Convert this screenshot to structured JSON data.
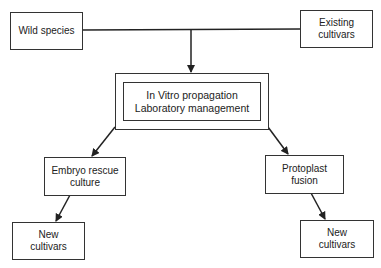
{
  "diagram": {
    "nodes": {
      "wild_species": "Wild species",
      "existing_cultivars_l1": "Existing",
      "existing_cultivars_l2": "cultivars",
      "in_vitro_l1": "In Vitro propagation",
      "in_vitro_l2": "Laboratory management",
      "embryo_l1": "Embryo rescue",
      "embryo_l2": "culture",
      "protoplast_l1": "Protoplast",
      "protoplast_l2": "fusion",
      "new_left_l1": "New",
      "new_left_l2": "cultivars",
      "new_right_l1": "New",
      "new_right_l2": "cultivars"
    },
    "edges": [
      {
        "from": "Wild species",
        "to": "In Vitro propagation / Laboratory management"
      },
      {
        "from": "Existing cultivars",
        "to": "In Vitro propagation / Laboratory management"
      },
      {
        "from": "In Vitro propagation / Laboratory management",
        "to": "Embryo rescue culture"
      },
      {
        "from": "In Vitro propagation / Laboratory management",
        "to": "Protoplast fusion"
      },
      {
        "from": "Embryo rescue culture",
        "to": "New cultivars (left)"
      },
      {
        "from": "Protoplast fusion",
        "to": "New cultivars (right)"
      }
    ],
    "line_color": "#222222"
  }
}
